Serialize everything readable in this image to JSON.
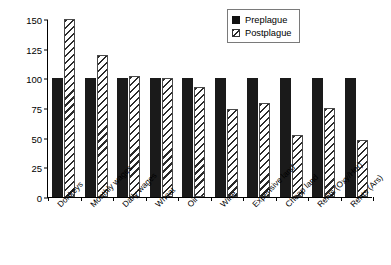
{
  "chart_data": {
    "type": "bar",
    "title": "",
    "subtitle": "",
    "xlabel": "",
    "ylabel": "",
    "ylim": [
      0,
      150
    ],
    "yticks": [
      0,
      25,
      50,
      75,
      100,
      125,
      150
    ],
    "grid": false,
    "legend_position": "top-right",
    "categories": [
      "Donkeys",
      "Monthly wages",
      "Daily wages",
      "Wheat",
      "Oil",
      "Wine",
      "Expensive land",
      "Cheap land",
      "Rents (Oxy/Her)",
      "Rents (Ars)"
    ],
    "series": [
      {
        "name": "Preplague",
        "fill": "solid-black",
        "color": "#1a1a1a",
        "values": [
          100,
          100,
          100,
          100,
          100,
          100,
          100,
          100,
          100,
          100
        ]
      },
      {
        "name": "Postplague",
        "fill": "diagonal-hatch",
        "color": "#2b2b2b",
        "values": [
          150,
          120,
          102,
          100,
          93,
          74,
          79,
          52,
          75,
          48
        ]
      }
    ]
  },
  "legend": {
    "items": [
      {
        "label": "Preplague"
      },
      {
        "label": "Postplague"
      }
    ]
  }
}
